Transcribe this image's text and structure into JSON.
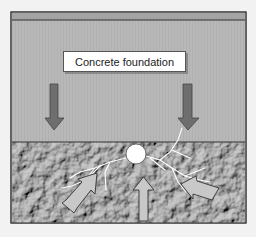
{
  "diagram": {
    "label": "Concrete foundation",
    "colors": {
      "background": "#f2f2f2",
      "foundation": "#b8b8b8",
      "foundation_top_bar": "#a4a4a4",
      "border": "#333333",
      "down_arrow": "#6e6e6e",
      "ground": "#8c8c8c",
      "up_arrow": "#c8c8c8",
      "crack": "#ffffff",
      "void_circle": "#ffffff"
    },
    "elements": {
      "down_arrows": 2,
      "up_arrows": 3,
      "void": "circle at foundation/soil interface with radiating cracks"
    }
  }
}
